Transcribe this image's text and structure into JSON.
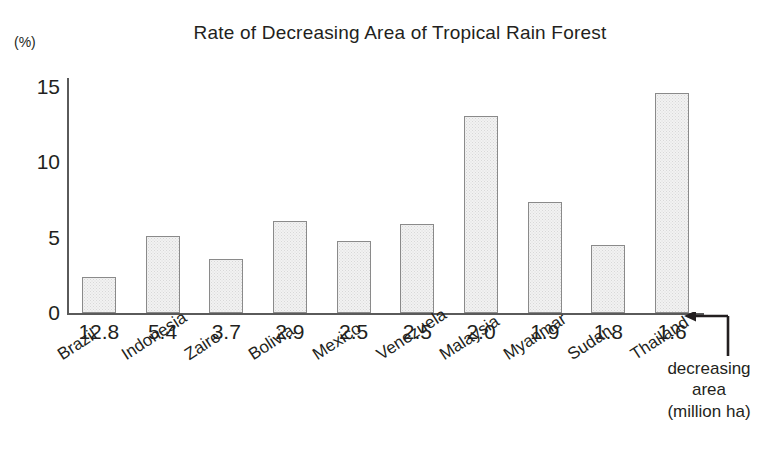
{
  "chart_data": {
    "type": "bar",
    "title": "Rate of Decreasing Area of Tropical Rain Forest",
    "unit_label": "(%)",
    "xlabel": "",
    "ylabel": "(%)",
    "ylim": [
      0,
      15.6
    ],
    "yticks": [
      "0",
      "5",
      "10",
      "15"
    ],
    "ytick_values": [
      0,
      5,
      10,
      15
    ],
    "grid": false,
    "legend": false,
    "categories": [
      "Brazil",
      "Indonesia",
      "Zaire",
      "Bolivia",
      "Mexico",
      "Venezuela",
      "Malaysia",
      "Myanmar",
      "Sudan",
      "Thailand"
    ],
    "values": [
      2.4,
      5.1,
      3.6,
      6.1,
      4.8,
      5.9,
      13.1,
      7.4,
      4.5,
      14.6
    ],
    "secondary_row_label": "decreasing area (million ha)",
    "secondary_values": [
      "12.8",
      "5.4",
      "3.7",
      "2.9",
      "2.5",
      "2.5",
      "2.0",
      "1.9",
      "1.8",
      "1.6"
    ],
    "annotation": {
      "line1": "decreasing",
      "line2": "area",
      "line3": "(million ha)",
      "arrow": "left-elbow-arrow"
    },
    "colors": {
      "bar_fill": "#f2f2f2",
      "bar_stroke": "#8a8a8a",
      "axis": "#5a5a5a",
      "text": "#231f20"
    }
  }
}
